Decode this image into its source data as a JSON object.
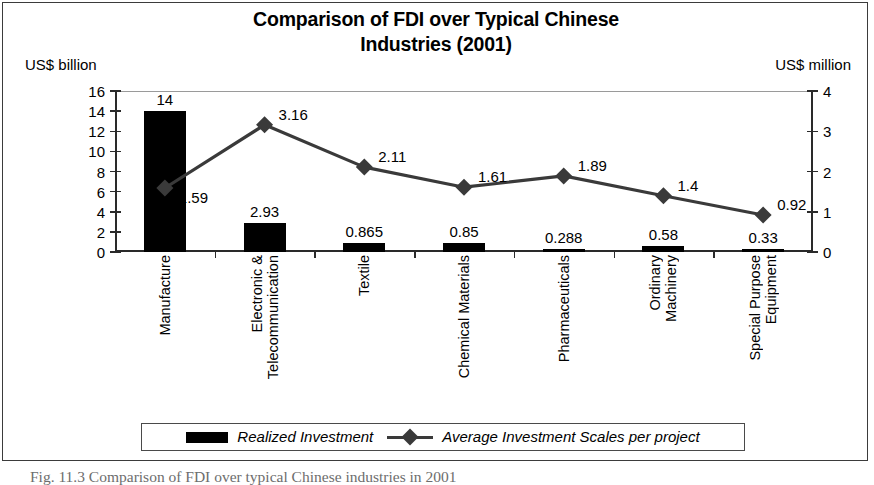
{
  "chart_data": {
    "type": "bar",
    "title": "Comparison of FDI over Typical Chinese Industries (2001)",
    "title_line1": "Comparison of FDI over Typical Chinese",
    "title_line2": "Industries (2001)",
    "categories": [
      "Manufacture",
      "Electronic & Telecommunication",
      "Textile",
      "Chemical Materials",
      "Pharmaceuticals",
      "Ordinary Machinery",
      "Special Purpose Equipment"
    ],
    "category_lines": [
      [
        "Manufacture"
      ],
      [
        "Electronic &",
        "Telecommunication"
      ],
      [
        "Textile"
      ],
      [
        "Chemical Materials"
      ],
      [
        "Pharmaceuticals"
      ],
      [
        "Ordinary",
        "Machinery"
      ],
      [
        "Special Purpose",
        "Equipment"
      ]
    ],
    "series": [
      {
        "name": "Realized Investment",
        "type": "bar",
        "axis": "left",
        "unit": "US$ billion",
        "values": [
          14,
          2.93,
          0.865,
          0.85,
          0.288,
          0.58,
          0.33
        ],
        "labels": [
          "14",
          "2.93",
          "0.865",
          "0.85",
          "0.288",
          "0.58",
          "0.33"
        ],
        "color": "#000000"
      },
      {
        "name": "Average Investment Scales per project",
        "type": "line",
        "axis": "right",
        "unit": "US$ million",
        "marker": "diamond",
        "values": [
          1.59,
          3.16,
          2.11,
          1.61,
          1.89,
          1.4,
          0.92
        ],
        "labels": [
          "1.59",
          "3.16",
          "2.11",
          "1.61",
          "1.89",
          "1.4",
          "0.92"
        ],
        "color": "#3a3a3a"
      }
    ],
    "left_axis": {
      "label": "US$ billion",
      "min": 0,
      "max": 16,
      "step": 2,
      "ticks": [
        "0",
        "2",
        "4",
        "6",
        "8",
        "10",
        "12",
        "14",
        "16"
      ]
    },
    "right_axis": {
      "label": "US$ million",
      "min": 0,
      "max": 4,
      "step": 1,
      "ticks": [
        "0",
        "1",
        "2",
        "3",
        "4"
      ]
    },
    "xlabel": "",
    "grid": false,
    "legend_position": "bottom"
  },
  "legend": {
    "entries": [
      {
        "label": "Realized Investment",
        "swatch": "bar"
      },
      {
        "label": "Average Investment Scales per project",
        "swatch": "line-diamond"
      }
    ]
  },
  "caption": {
    "text": "Fig. 11.3 Comparison of FDI over typical Chinese industries in 2001"
  }
}
